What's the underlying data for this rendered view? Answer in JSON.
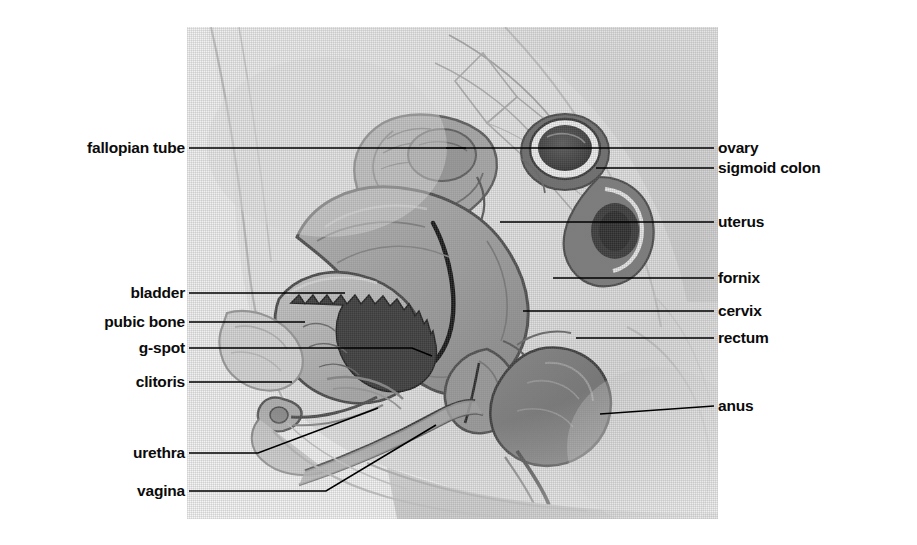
{
  "diagram": {
    "type": "anatomical-illustration",
    "style": "grayscale halftone scan",
    "plate": {
      "x": 187,
      "y": 27,
      "width": 531,
      "height": 492
    },
    "colors": {
      "background": "#ffffff",
      "label_text": "#0b0b0b",
      "leader_line": "#000000",
      "plate_base": "#f3f3f3"
    }
  },
  "labels_left": [
    {
      "text": "fallopian tube",
      "x": 185,
      "y": 148
    },
    {
      "text": "bladder",
      "x": 185,
      "y": 293
    },
    {
      "text": "pubic bone",
      "x": 185,
      "y": 322
    },
    {
      "text": "g-spot",
      "x": 185,
      "y": 348
    },
    {
      "text": "clitoris",
      "x": 185,
      "y": 382
    },
    {
      "text": "urethra",
      "x": 185,
      "y": 453
    },
    {
      "text": "vagina",
      "x": 185,
      "y": 491
    }
  ],
  "labels_right": [
    {
      "text": "ovary",
      "x": 722,
      "y": 145
    },
    {
      "text": "sigmoid colon",
      "x": 722,
      "y": 167
    },
    {
      "text": "uterus",
      "x": 722,
      "y": 220
    },
    {
      "text": "fornix",
      "x": 722,
      "y": 277
    },
    {
      "text": "cervix",
      "x": 722,
      "y": 310
    },
    {
      "text": "rectum",
      "x": 722,
      "y": 337
    },
    {
      "text": "anus",
      "x": 722,
      "y": 410
    }
  ]
}
